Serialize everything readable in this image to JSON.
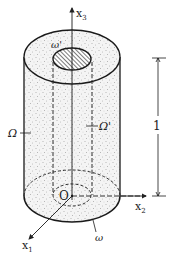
{
  "diagram": {
    "type": "hollow-cylinder",
    "colors": {
      "stroke": "#1a1a1a",
      "fill_stipple": "#f2f2f2",
      "dots": "#888888",
      "hatch": "#444444",
      "background": "#ffffff"
    },
    "axes": {
      "x1": {
        "label": "x",
        "sub": "1"
      },
      "x2": {
        "label": "x",
        "sub": "2"
      },
      "x3": {
        "label": "x",
        "sub": "3"
      }
    },
    "origin_label": "O",
    "labels": {
      "outer_domain": "Ω",
      "inner_domain": "Ω'",
      "top_hole": "ω'",
      "bottom_section": "ω"
    },
    "dimension": {
      "value": "1"
    }
  }
}
